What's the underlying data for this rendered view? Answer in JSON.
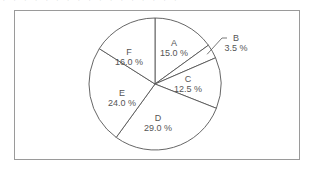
{
  "header": {
    "clipped_text": "· · · · · · · ·  · · · · · · · · ·"
  },
  "chart_data": {
    "type": "pie",
    "title": "",
    "start_angle_deg": 0,
    "direction": "clockwise",
    "categories": [
      "A",
      "B",
      "C",
      "D",
      "E",
      "F"
    ],
    "values": [
      15.0,
      3.5,
      12.5,
      29.0,
      24.0,
      16.0
    ],
    "labels": [
      "15.0 %",
      "3.5 %",
      "12.5 %",
      "29.0 %",
      "24.0 %",
      "16.0 %"
    ],
    "slice_fill": "#ffffff",
    "slice_stroke": "#555555",
    "leader_lines": [
      {
        "category": "B",
        "outside_label": true
      }
    ],
    "legend": "none"
  }
}
